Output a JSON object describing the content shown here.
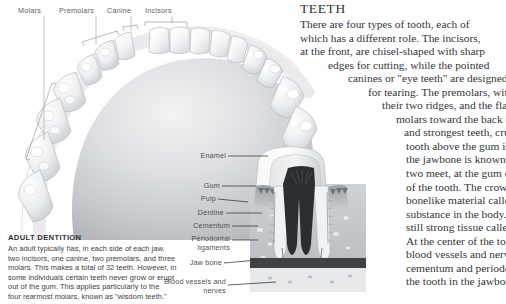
{
  "arch": {
    "labels": [
      {
        "id": "molars",
        "text": "Molars"
      },
      {
        "id": "premolars",
        "text": "Premolars"
      },
      {
        "id": "canine",
        "text": "Canine"
      },
      {
        "id": "incisors",
        "text": "Incisors"
      }
    ]
  },
  "cross_section": {
    "labels": [
      {
        "id": "enamel",
        "text": "Enamel"
      },
      {
        "id": "gum",
        "text": "Gum"
      },
      {
        "id": "pulp",
        "text": "Pulp"
      },
      {
        "id": "dentine",
        "text": "Dentine"
      },
      {
        "id": "cementum",
        "text": "Cementum"
      },
      {
        "id": "periodontal",
        "text": "Periodontal ligaments"
      },
      {
        "id": "jawbone",
        "text": "Jaw bone"
      },
      {
        "id": "bloodvessels",
        "text": "Blood vessels and nerves"
      }
    ]
  },
  "adult_dentition": {
    "title": "ADULT DENTITION",
    "lines": [
      "An adult typically has, in each side of each jaw,",
      "two incisors, one canine, two premolars, and three",
      "molars. This makes a total of 32 teeth. However, in",
      "some individuals certain teeth never grow or erupt",
      "out of the gum. This applies particularly to the",
      "four rearmost molars, known as \"wisdom teeth.\""
    ]
  },
  "teeth_article": {
    "title": "TEETH",
    "lines": [
      {
        "text": "There are four types of tooth, each of",
        "indent": 56
      },
      {
        "text": "which has a different role. The incisors,",
        "indent": 56
      },
      {
        "text": "at the front, are chisel-shaped with sharp",
        "indent": 56
      },
      {
        "text": "edges for cutting, while the pointed",
        "indent": 84
      },
      {
        "text": "canines or \"eye teeth\" are designed",
        "indent": 104
      },
      {
        "text": "for tearing. The premolars, with",
        "indent": 124
      },
      {
        "text": "their two ridges, and the flatter",
        "indent": 138
      },
      {
        "text": "molars toward the back of the jaw,",
        "indent": 152
      },
      {
        "text": "and strongest teeth, crush and grind.",
        "indent": 160
      },
      {
        "text": "tooth above the gum is the crown; that in",
        "indent": 162
      },
      {
        "text": "the jawbone is known as the root. Where the",
        "indent": 162
      },
      {
        "text": "two meet, at the gum or gingiva, is the neck",
        "indent": 162
      },
      {
        "text": "of the tooth. The crown's outer layer is a",
        "indent": 162
      },
      {
        "text": "bonelike material called enamel, the hardest",
        "indent": 162
      },
      {
        "text": "substance in the body. Beneath it is a softer",
        "indent": 162
      },
      {
        "text": "still strong tissue called dentine.",
        "indent": 162
      },
      {
        "text": "At the center of the tooth is the pulp, with",
        "indent": 162
      },
      {
        "text": "blood vessels and nerves. A layer of",
        "indent": 162
      },
      {
        "text": "cementum and periodontal ligaments anchor",
        "indent": 162
      },
      {
        "text": "the tooth in the jawbone.",
        "indent": 162
      }
    ]
  },
  "palette": {
    "label_gray": "#5d6065",
    "text_dark": "#33363a",
    "leader_line": "#8a8d92",
    "tooth_white": "#fdfdfd",
    "palate_gray": "#c9ccd0"
  }
}
